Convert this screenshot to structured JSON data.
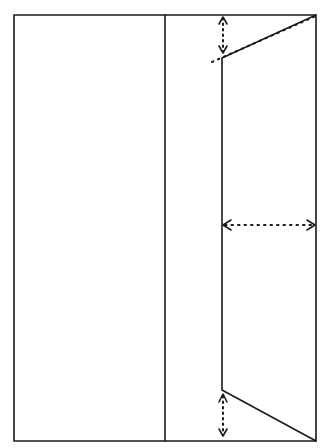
{
  "diagram": {
    "colors": {
      "stroke": "#1a1a1a",
      "background": "#ffffff"
    },
    "outer_rect": {
      "x1": 14,
      "y1": 15,
      "x2": 316,
      "y2": 441
    },
    "divider_x": 165,
    "trapezoid": {
      "left_x": 222,
      "top_left_y": 58,
      "bottom_left_y": 390,
      "right_x": 316,
      "top_right_y": 15,
      "bottom_right_y": 441
    },
    "arrows": [
      {
        "name": "top-vertical-arrow",
        "orientation": "vertical",
        "x": 223,
        "y1": 16,
        "y2": 54
      },
      {
        "name": "middle-horizontal-arrow",
        "orientation": "horizontal",
        "y": 225,
        "x1": 223,
        "x2": 315
      },
      {
        "name": "bottom-vertical-arrow",
        "orientation": "vertical",
        "x": 223,
        "y1": 393,
        "y2": 437
      }
    ],
    "dotted_extension": {
      "x1": 212,
      "y1": 58,
      "x2": 316,
      "y2": 15
    }
  }
}
